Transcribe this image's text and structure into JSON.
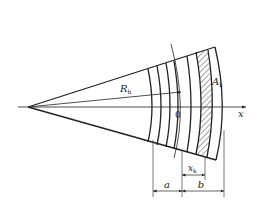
{
  "figure": {
    "type": "sector diagram with concentric arc layers",
    "labels": {
      "radius": "R",
      "radius_sub": "h",
      "origin": "0",
      "axis": "x",
      "area": "A",
      "area_sub": "k",
      "offset": "x",
      "offset_sub": "k",
      "dim_a": "a",
      "dim_b": "b"
    },
    "colors": {
      "line": "#222222",
      "background": "#ffffff"
    }
  }
}
